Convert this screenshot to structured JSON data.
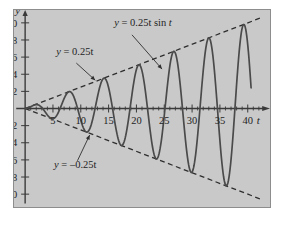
{
  "figure": {
    "background_color": "#c9c9c9",
    "page_color": "#ffffff",
    "border_color": "#8d8d8d",
    "curve_color": "#4a4a4a",
    "envelope_color": "#2f2f2f",
    "axis_color": "#3a3a3a"
  },
  "chart_data": {
    "type": "line",
    "title": "",
    "xlabel": "t",
    "ylabel": "y",
    "xlim": [
      -2,
      44
    ],
    "ylim": [
      -11.5,
      11.5
    ],
    "grid": false,
    "legend_position": "none",
    "xticks": [
      5,
      10,
      15,
      20,
      25,
      30,
      35,
      40
    ],
    "xtick_labels": [
      "5",
      "10",
      "15",
      "20",
      "25",
      "30",
      "35",
      "40"
    ],
    "x_minor_tick_step": 1,
    "yticks": [
      10,
      8,
      6,
      4,
      2,
      -2,
      -4,
      -6,
      -8,
      -10
    ],
    "ytick_labels": [
      "10",
      "8",
      "6",
      "4",
      "2",
      "–2",
      "–4",
      "–6",
      "–8",
      "–10"
    ],
    "series": [
      {
        "name": "y = 0.25t sin t",
        "style": "solid",
        "formula": "0.25*t*sin(t)",
        "t_start": 0,
        "t_end": 40.6,
        "samples": 420
      },
      {
        "name": "y = 0.25t",
        "style": "dashed",
        "formula": "0.25*t",
        "t_start": 0,
        "t_end": 42.5
      },
      {
        "name": "y = -0.25t",
        "style": "dashed",
        "formula": "-0.25*t",
        "t_start": 0,
        "t_end": 42.5
      }
    ],
    "annotations": [
      {
        "id": "curve-label",
        "text": "y = 0.25t sin t",
        "text_x": 16.0,
        "text_y": 9.6,
        "leader_from_x": 19.2,
        "leader_from_y": 8.6,
        "leader_to_x": 24.6,
        "leader_to_y": 4.6
      },
      {
        "id": "upper-envelope-label",
        "text": "y = 0.25t",
        "text_x": 5.6,
        "text_y": 6.2,
        "leader_from_x": 9.2,
        "leader_from_y": 5.3,
        "leader_to_x": 12.6,
        "leader_to_y": 3.3
      },
      {
        "id": "lower-envelope-label",
        "text": "y = –0.25t",
        "text_x": 5.2,
        "text_y": -6.9,
        "leader_from_x": 9.4,
        "leader_from_y": -6.1,
        "leader_to_x": 11.6,
        "leader_to_y": -3.1
      }
    ]
  }
}
